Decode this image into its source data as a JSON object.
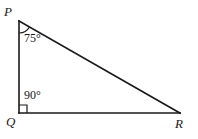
{
  "figure": {
    "type": "geometry-diagram",
    "shape": "right-triangle",
    "background_color": "#ffffff",
    "stroke_color": "#1a1a1a",
    "vertices": [
      {
        "name": "P",
        "label": "P",
        "x": 19,
        "y": 21
      },
      {
        "name": "Q",
        "label": "Q",
        "x": 19,
        "y": 113
      },
      {
        "name": "R",
        "label": "R",
        "x": 180,
        "y": 113
      }
    ],
    "sides": [
      {
        "name": "PQ",
        "from": "P",
        "to": "Q"
      },
      {
        "name": "QR",
        "from": "Q",
        "to": "R"
      },
      {
        "name": "PR",
        "from": "P",
        "to": "R"
      }
    ],
    "angles": [
      {
        "at": "P",
        "label": "75°",
        "marker": "arc"
      },
      {
        "at": "Q",
        "label": "90°",
        "marker": "right-angle-square"
      }
    ]
  }
}
